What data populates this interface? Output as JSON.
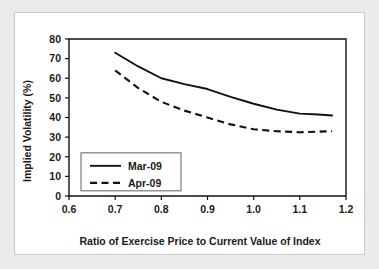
{
  "chart_data": {
    "type": "line",
    "title": "",
    "xlabel": "Ratio of Exercise Price to Current Value of Index",
    "ylabel": "Implied Volatility (%)",
    "xlim": [
      0.6,
      1.2
    ],
    "ylim": [
      0,
      80
    ],
    "xticks": [
      "0.6",
      "0.7",
      "0.8",
      "0.9",
      "1.0",
      "1.1",
      "1.2"
    ],
    "yticks": [
      "0",
      "10",
      "20",
      "30",
      "40",
      "50",
      "60",
      "70",
      "80"
    ],
    "grid": false,
    "legend_position": "lower-left-inside",
    "x": [
      0.7,
      0.75,
      0.8,
      0.85,
      0.9,
      0.95,
      1.0,
      1.05,
      1.1,
      1.14,
      1.17
    ],
    "series": [
      {
        "name": "Mar-09",
        "style": "solid",
        "color": "#111111",
        "values": [
          73,
          66,
          60,
          57,
          54.5,
          50.5,
          47,
          44,
          42,
          41.5,
          41
        ]
      },
      {
        "name": "Apr-09",
        "style": "dashed",
        "color": "#111111",
        "values": [
          64,
          55,
          48,
          43.5,
          40,
          36.5,
          34,
          33,
          32.5,
          32.8,
          33
        ]
      }
    ]
  }
}
